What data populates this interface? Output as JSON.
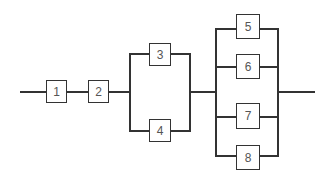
{
  "diagram": {
    "type": "reliability-block-diagram",
    "line_color": "#333333",
    "blocks": [
      {
        "id": "1",
        "label": "1",
        "group": "series"
      },
      {
        "id": "2",
        "label": "2",
        "group": "series"
      },
      {
        "id": "3",
        "label": "3",
        "group": "parallel-a"
      },
      {
        "id": "4",
        "label": "4",
        "group": "parallel-a"
      },
      {
        "id": "5",
        "label": "5",
        "group": "parallel-b"
      },
      {
        "id": "6",
        "label": "6",
        "group": "parallel-b"
      },
      {
        "id": "7",
        "label": "7",
        "group": "parallel-b"
      },
      {
        "id": "8",
        "label": "8",
        "group": "parallel-b"
      }
    ],
    "structure": "1 -> 2 -> (3 || 4) -> (5 || 6 || 7 || 8)"
  }
}
